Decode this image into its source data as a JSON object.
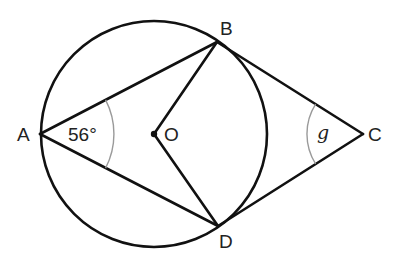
{
  "diagram": {
    "points": {
      "A": {
        "label": "A",
        "x": 40,
        "y": 134
      },
      "B": {
        "label": "B",
        "x": 217,
        "y": 42
      },
      "C": {
        "label": "C",
        "x": 363,
        "y": 134
      },
      "D": {
        "label": "D",
        "x": 218,
        "y": 226
      },
      "O": {
        "label": "O",
        "x": 154,
        "y": 134
      }
    },
    "circle": {
      "cx": 154,
      "cy": 134,
      "r": 113
    },
    "angles": {
      "A": {
        "text": "56°",
        "value": 56,
        "unit": "degrees"
      },
      "C": {
        "text": "g",
        "variable": "g"
      }
    },
    "segments": [
      "AB",
      "AD",
      "OB",
      "OD",
      "BC",
      "DC"
    ],
    "colors": {
      "line": "#111111",
      "arc": "#9a9a9a",
      "text": "#222222",
      "background": "#ffffff"
    }
  }
}
